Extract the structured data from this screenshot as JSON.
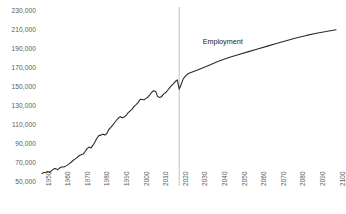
{
  "chart_data": {
    "type": "line",
    "title": "",
    "subtitle": "",
    "xlabel": "",
    "ylabel": "",
    "xlim": [
      1950,
      2100
    ],
    "ylim": [
      50000,
      230000
    ],
    "grid": false,
    "legend": "none",
    "annotations": [
      {
        "text": "Employment",
        "x": 2032,
        "y": 198000
      }
    ],
    "vertical_markers": [
      {
        "x": 2020,
        "label": ""
      }
    ],
    "ytick_labels": [
      "230,000",
      "210,000",
      "190,000",
      "170,000",
      "150,000",
      "130,000",
      "110,000",
      "90,000",
      "70,000",
      "50,000"
    ],
    "ytick_values": [
      230000,
      210000,
      190000,
      170000,
      150000,
      130000,
      110000,
      90000,
      70000,
      50000
    ],
    "xtick_labels": [
      "1950",
      "1960",
      "1970",
      "1980",
      "1990",
      "2000",
      "2010",
      "2020",
      "2030",
      "2040",
      "2050",
      "2060",
      "2070",
      "2080",
      "2090",
      "2100"
    ],
    "xtick_values": [
      1950,
      1960,
      1970,
      1980,
      1990,
      2000,
      2010,
      2020,
      2030,
      2040,
      2050,
      2060,
      2070,
      2080,
      2090,
      2100
    ],
    "series": [
      {
        "name": "Employment",
        "color": "#2b2b2b",
        "x": [
          1950,
          1951,
          1952,
          1953,
          1954,
          1955,
          1956,
          1957,
          1958,
          1959,
          1960,
          1961,
          1962,
          1963,
          1964,
          1965,
          1966,
          1967,
          1968,
          1969,
          1970,
          1971,
          1972,
          1973,
          1974,
          1975,
          1976,
          1977,
          1978,
          1979,
          1980,
          1981,
          1982,
          1983,
          1984,
          1985,
          1986,
          1987,
          1988,
          1989,
          1990,
          1991,
          1992,
          1993,
          1994,
          1995,
          1996,
          1997,
          1998,
          1999,
          2000,
          2001,
          2002,
          2003,
          2004,
          2005,
          2006,
          2007,
          2008,
          2009,
          2010,
          2011,
          2012,
          2013,
          2014,
          2015,
          2016,
          2017,
          2018,
          2019,
          2020,
          2021,
          2022,
          2023,
          2024,
          2025,
          2030,
          2035,
          2040,
          2045,
          2050,
          2055,
          2060,
          2065,
          2070,
          2075,
          2080,
          2085,
          2090,
          2095,
          2100
        ],
        "y": [
          58900,
          59960,
          60250,
          61180,
          60110,
          62170,
          63800,
          64070,
          63000,
          64630,
          65780,
          65750,
          66700,
          67760,
          69300,
          71090,
          72900,
          74370,
          75920,
          77900,
          78680,
          79370,
          82150,
          85060,
          86790,
          85850,
          88750,
          92020,
          96050,
          98820,
          99300,
          100400,
          99530,
          100830,
          105000,
          107150,
          109600,
          112400,
          115000,
          117340,
          118790,
          117720,
          118490,
          120260,
          123060,
          124900,
          126710,
          129560,
          131460,
          133490,
          136890,
          136930,
          136490,
          137740,
          139250,
          141730,
          144430,
          146050,
          145360,
          139880,
          139060,
          139870,
          142470,
          143930,
          146300,
          148830,
          151430,
          153340,
          155760,
          157540,
          147800,
          152580,
          158290,
          161040,
          163080,
          164400,
          168500,
          172700,
          177000,
          180700,
          184000,
          187000,
          190000,
          193000,
          196000,
          199000,
          201800,
          204300,
          206500,
          208500,
          210300
        ]
      }
    ]
  },
  "axis": {
    "y_title": "",
    "x_title": ""
  }
}
